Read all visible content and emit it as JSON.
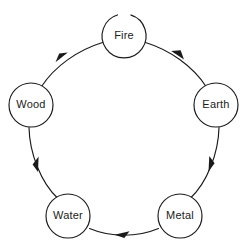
{
  "diagram": {
    "type": "cycle-diagram",
    "background_color": "#ffffff",
    "stroke_color": "#1a1a1a",
    "text_color": "#1b1b1b",
    "nodes": [
      {
        "id": "fire",
        "label": "Fire",
        "cx": 124,
        "cy": 36,
        "r": 22
      },
      {
        "id": "earth",
        "label": "Earth",
        "cx": 216,
        "cy": 105,
        "r": 22
      },
      {
        "id": "metal",
        "label": "Metal",
        "cx": 180,
        "cy": 216,
        "r": 22
      },
      {
        "id": "water",
        "label": "Water",
        "cx": 68,
        "cy": 216,
        "r": 22
      },
      {
        "id": "wood",
        "label": "Wood",
        "cx": 31,
        "cy": 105,
        "r": 22
      }
    ],
    "edges": [
      {
        "id": "wood-to-fire",
        "from": "Wood",
        "to": "Fire",
        "direction": "clockwise"
      },
      {
        "id": "fire-to-earth",
        "from": "Fire",
        "to": "Earth",
        "direction": "clockwise"
      },
      {
        "id": "earth-to-metal",
        "from": "Earth",
        "to": "Metal",
        "direction": "clockwise"
      },
      {
        "id": "metal-to-water",
        "from": "Metal",
        "to": "Water",
        "direction": "clockwise"
      },
      {
        "id": "water-to-wood",
        "from": "Water",
        "to": "Wood",
        "direction": "clockwise"
      }
    ]
  }
}
